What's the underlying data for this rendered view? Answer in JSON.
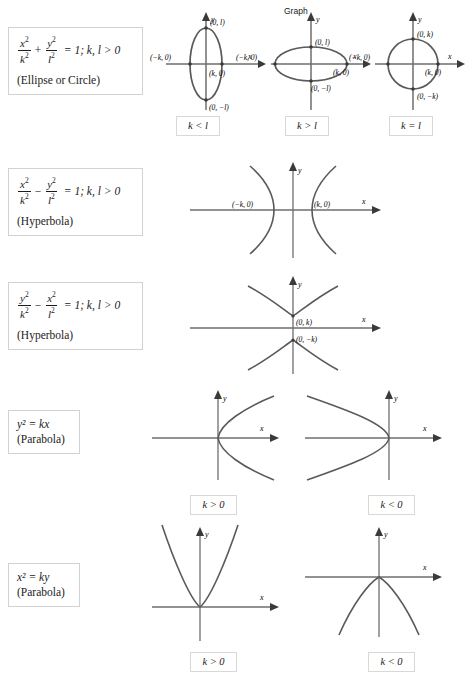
{
  "header": {
    "graph_label": "Graph"
  },
  "axis": {
    "x": "x",
    "y": "y"
  },
  "rows": [
    {
      "id": "ellipse",
      "equation": {
        "num1": "x",
        "den1": "k",
        "op": "+",
        "num2": "y",
        "den2": "l",
        "rhs": "= 1; k, l > 0",
        "name": "(Ellipse or Circle)"
      },
      "graphs": [
        {
          "id": "ellipse-tall",
          "condition": "k < l",
          "points": [
            "(0, l)",
            "(k, 0)",
            "(0, −l)",
            "(−k, 0)"
          ]
        },
        {
          "id": "ellipse-wide",
          "condition": "k > l",
          "points": [
            "(0, l)",
            "(k, 0)",
            "(0, −l)",
            "(−k, 0)"
          ]
        },
        {
          "id": "circle",
          "condition": "k = l",
          "points": [
            "(0, k)",
            "(k, 0)",
            "(0, −k)",
            "(−k, 0)"
          ]
        }
      ]
    },
    {
      "id": "hyperbola-horizontal",
      "equation": {
        "num1": "x",
        "den1": "k",
        "op": "−",
        "num2": "y",
        "den2": "l",
        "rhs": "= 1; k, l > 0",
        "name": "(Hyperbola)"
      },
      "graphs": [
        {
          "id": "hyperbola-east-west",
          "condition": "",
          "points": [
            "(−k, 0)",
            "(k, 0)"
          ]
        }
      ]
    },
    {
      "id": "hyperbola-vertical",
      "equation": {
        "num1": "y",
        "den1": "k",
        "op": "−",
        "num2": "x",
        "den2": "l",
        "rhs": "= 1; k, l > 0",
        "name": "(Hyperbola)"
      },
      "graphs": [
        {
          "id": "hyperbola-north-south",
          "condition": "",
          "points": [
            "(0, k)",
            "(0, −k)"
          ]
        }
      ]
    },
    {
      "id": "parabola-horizontal",
      "equation": {
        "simple": "y² = kx",
        "name": "(Parabola)"
      },
      "graphs": [
        {
          "id": "parabola-right",
          "condition": "k > 0",
          "points": []
        },
        {
          "id": "parabola-left",
          "condition": "k < 0",
          "points": []
        }
      ]
    },
    {
      "id": "parabola-vertical",
      "equation": {
        "simple": "x² = ky",
        "name": "(Parabola)"
      },
      "graphs": [
        {
          "id": "parabola-up",
          "condition": "k > 0",
          "points": []
        },
        {
          "id": "parabola-down",
          "condition": "k < 0",
          "points": []
        }
      ]
    }
  ],
  "colors": {
    "curve": "#5a5a5a",
    "axis": "#6e6e6e",
    "text": "#1b1b1b",
    "box_border": "#d2d2d2",
    "background": "#ffffff"
  }
}
